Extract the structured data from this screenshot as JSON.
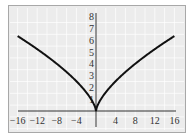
{
  "chart_data": {
    "type": "line",
    "title": "",
    "xlabel": "",
    "ylabel": "",
    "xlim": [
      -16,
      16
    ],
    "ylim": [
      0,
      8
    ],
    "grid": true,
    "x_ticks": [
      "-16",
      "-12",
      "-8",
      "-4",
      "4",
      "8",
      "12",
      "16"
    ],
    "y_ticks": [
      "1",
      "2",
      "3",
      "4",
      "5",
      "6",
      "7",
      "8"
    ],
    "series": [
      {
        "name": "y = x^(2/3)",
        "x": [
          -16,
          -12,
          -8,
          -4,
          -2,
          -1,
          0,
          1,
          2,
          4,
          8,
          12,
          16
        ],
        "values": [
          6.35,
          5.24,
          4.0,
          2.52,
          1.59,
          1.0,
          0,
          1.0,
          1.59,
          2.52,
          4.0,
          5.24,
          6.35
        ]
      }
    ],
    "colors": {
      "curve": "#111111",
      "background": "#ececec",
      "grid": "#ffffff",
      "axis": "#333333"
    }
  }
}
